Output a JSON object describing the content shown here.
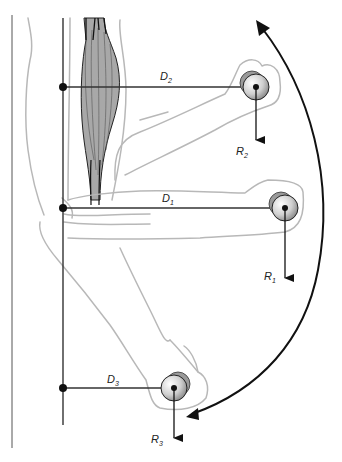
{
  "diagram": {
    "labels": {
      "d1": "D",
      "d1_sub": "1",
      "d2": "D",
      "d2_sub": "2",
      "d3": "D",
      "d3_sub": "3",
      "r1": "R",
      "r1_sub": "1",
      "r2": "R",
      "r2_sub": "2",
      "r3": "R",
      "r3_sub": "3"
    },
    "positions": [
      {
        "name": "forearm-raised",
        "moment_arm_label": "D2",
        "force_label": "R2",
        "axis_point": [
          63,
          87
        ],
        "weight_center": [
          256,
          87
        ]
      },
      {
        "name": "forearm-horizontal",
        "moment_arm_label": "D1",
        "force_label": "R1",
        "axis_point": [
          63,
          208
        ],
        "weight_center": [
          285,
          208
        ]
      },
      {
        "name": "forearm-lowered",
        "moment_arm_label": "D3",
        "force_label": "R3",
        "axis_point": [
          63,
          388
        ],
        "weight_center": [
          174,
          388
        ]
      }
    ],
    "colors": {
      "line": "#333333",
      "outline": "#b8b8b8",
      "muscle_fill": "#a8a8a8",
      "background": "#ffffff"
    }
  }
}
